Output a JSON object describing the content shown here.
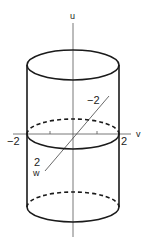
{
  "figure": {
    "axes": {
      "u": {
        "label": "u"
      },
      "v": {
        "label": "v",
        "tick_neg": "−2",
        "tick_pos": "2"
      },
      "w": {
        "label": "w",
        "tick_neg": "−2",
        "tick_pos": "2"
      }
    },
    "colors": {
      "stroke": "#1a1a1a",
      "axis": "#555555",
      "background": "#ffffff"
    }
  }
}
